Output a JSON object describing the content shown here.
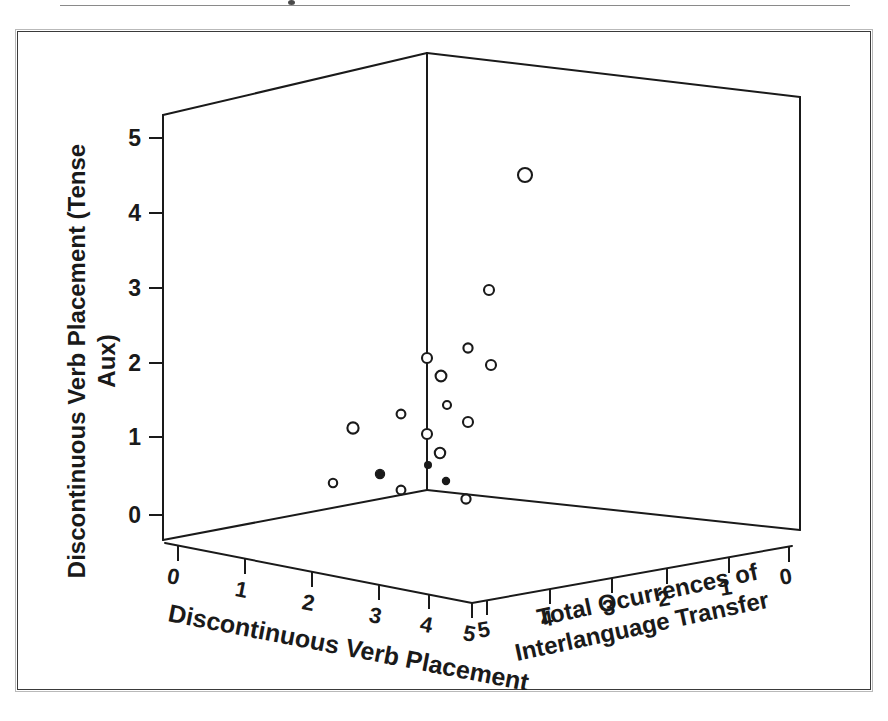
{
  "figure": {
    "caption_rule": true,
    "border_color": "#3a3a3a",
    "ink_color": "#1a1a1a",
    "background": "#ffffff"
  },
  "chart_data": {
    "type": "scatter",
    "projection": "3d",
    "title": "",
    "xlabel": "Discontinuous Verb Placement",
    "ylabel": "Discontinuous Verb Placement (Tense Aux)",
    "zlabel": "Total Ocurrences of Interlanguage Transfer",
    "xlim": [
      0,
      5
    ],
    "ylim": [
      0,
      5
    ],
    "zlim": [
      0,
      5
    ],
    "xticks": [
      "0",
      "1",
      "2",
      "3",
      "4",
      "5"
    ],
    "yticks": [
      "0",
      "1",
      "2",
      "3",
      "4",
      "5"
    ],
    "zticks": [
      "5",
      "4",
      "3",
      "2",
      "1",
      "0"
    ],
    "grid": false,
    "legend": "none",
    "marker": "open-circle",
    "marker_filled": "filled-circle",
    "points": [
      {
        "px": 525,
        "py": 175,
        "r": 7.0,
        "filled": false
      },
      {
        "px": 489,
        "py": 290,
        "r": 5.0,
        "filled": false
      },
      {
        "px": 468,
        "py": 348,
        "r": 4.6,
        "filled": false
      },
      {
        "px": 491,
        "py": 365,
        "r": 5.0,
        "filled": false
      },
      {
        "px": 427,
        "py": 358,
        "r": 5.0,
        "filled": false
      },
      {
        "px": 441,
        "py": 376,
        "r": 5.4,
        "filled": false
      },
      {
        "px": 447,
        "py": 405,
        "r": 4.0,
        "filled": false
      },
      {
        "px": 401,
        "py": 414,
        "r": 4.4,
        "filled": false
      },
      {
        "px": 353,
        "py": 428,
        "r": 5.6,
        "filled": false
      },
      {
        "px": 468,
        "py": 422,
        "r": 5.0,
        "filled": false
      },
      {
        "px": 427,
        "py": 434,
        "r": 5.0,
        "filled": false
      },
      {
        "px": 440,
        "py": 453,
        "r": 5.2,
        "filled": false
      },
      {
        "px": 428,
        "py": 465,
        "r": 3.4,
        "filled": true
      },
      {
        "px": 380,
        "py": 474,
        "r": 4.6,
        "filled": true
      },
      {
        "px": 333,
        "py": 483,
        "r": 4.2,
        "filled": false
      },
      {
        "px": 446,
        "py": 481,
        "r": 3.6,
        "filled": true
      },
      {
        "px": 401,
        "py": 490,
        "r": 4.4,
        "filled": false
      },
      {
        "px": 466,
        "py": 499,
        "r": 4.6,
        "filled": false
      }
    ]
  },
  "axes": {
    "y_axis_name": "y-axis-vertical",
    "x_axis_name": "x-axis-depth-left",
    "z_axis_name": "z-axis-depth-right"
  }
}
